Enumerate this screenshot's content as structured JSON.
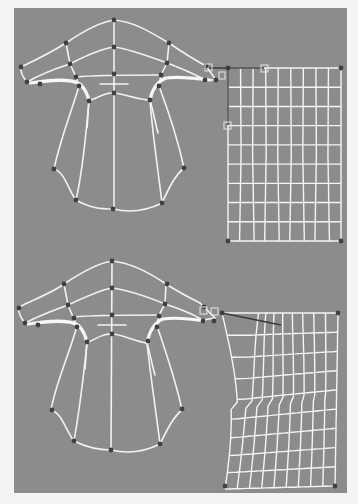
{
  "figure": {
    "background_color": "#8c8c8c",
    "page_color": "#f4f4f4",
    "wire_color": "#f2f2f2",
    "point_color": "#404040",
    "tangent_color": "#3a3a3a",
    "panel": {
      "x": 14,
      "y": 8,
      "w": 333,
      "h": 485
    },
    "panels": [
      {
        "name": "before-blend",
        "offset_y": 0,
        "patch": {
          "type": "rectangular",
          "x0": 228,
          "y0": 68,
          "x1": 341,
          "y1": 241,
          "cols": 9,
          "rows": 9,
          "corner_points": [
            [
              228,
              68
            ],
            [
              341,
              68
            ],
            [
              228,
              241
            ],
            [
              341,
              241
            ]
          ],
          "tangent_handles": [
            [
              209,
              68
            ],
            [
              222,
              75
            ],
            [
              264,
              68
            ],
            [
              228,
              125
            ]
          ]
        }
      },
      {
        "name": "after-blend",
        "offset_y": 0,
        "patch": {
          "type": "deformed",
          "top_left": [
            222,
            313
          ],
          "top_right": [
            338,
            313
          ],
          "bottom_left": [
            225,
            486
          ],
          "bottom_right": [
            335,
            486
          ],
          "cols": 9,
          "rows": 9,
          "corner_points": [
            [
              222,
              313
            ],
            [
              338,
              313
            ],
            [
              225,
              486
            ],
            [
              335,
              486
            ]
          ],
          "tangent_handles": [
            [
              203,
              310
            ],
            [
              214,
              312
            ],
            [
              281,
              325
            ]
          ]
        }
      }
    ],
    "garment_points": [
      [
        114,
        20
      ],
      [
        66,
        43
      ],
      [
        169,
        43
      ],
      [
        114,
        47
      ],
      [
        70,
        64
      ],
      [
        167,
        63
      ],
      [
        21,
        67
      ],
      [
        114,
        74
      ],
      [
        206,
        66
      ],
      [
        76,
        77
      ],
      [
        161,
        75
      ],
      [
        27,
        82
      ],
      [
        40,
        84
      ],
      [
        79,
        86
      ],
      [
        159,
        86
      ],
      [
        205,
        80
      ],
      [
        216,
        80
      ],
      [
        114,
        93
      ],
      [
        89,
        101
      ],
      [
        150,
        100
      ],
      [
        54,
        169
      ],
      [
        184,
        168
      ],
      [
        76,
        200
      ],
      [
        162,
        203
      ],
      [
        113,
        209
      ]
    ]
  }
}
